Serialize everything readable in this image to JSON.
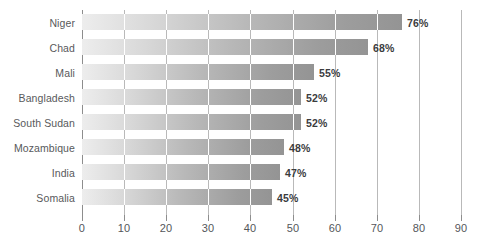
{
  "chart_data": {
    "type": "bar",
    "orientation": "horizontal",
    "title": "",
    "subtitle": "",
    "xlabel": "",
    "ylabel": "",
    "xlim": [
      0,
      90
    ],
    "grid": true,
    "legend": null,
    "categories": [
      "Niger",
      "Chad",
      "Mali",
      "Bangladesh",
      "South Sudan",
      "Mozambique",
      "India",
      "Somalia"
    ],
    "values": [
      76,
      68,
      55,
      52,
      52,
      48,
      47,
      45
    ],
    "value_labels": [
      "76%",
      "68%",
      "55%",
      "52%",
      "52%",
      "48%",
      "47%",
      "45%"
    ],
    "xticks": [
      0,
      10,
      20,
      30,
      40,
      50,
      60,
      70,
      80,
      90
    ],
    "xtick_labels": [
      "0",
      "10",
      "20",
      "30",
      "40",
      "50",
      "60",
      "70",
      "80",
      "90"
    ],
    "colors": {
      "bar_gradient_start": "#ededed",
      "bar_gradient_end": "#949494",
      "gridline": "#b9b9b9",
      "axis": "#8d8d8d",
      "category_text": "#58595b",
      "tick_text": "#54565a",
      "value_text": "#3b3c3e",
      "background": "#ffffff"
    }
  }
}
